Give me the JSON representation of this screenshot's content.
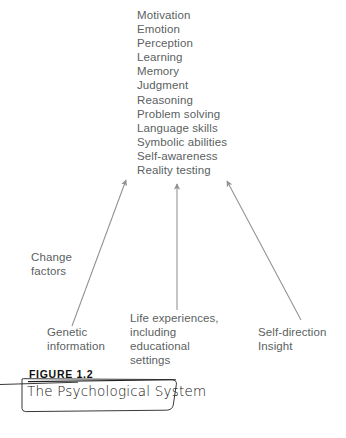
{
  "figure": {
    "number": "FIGURE 1.2",
    "title": "The Psychological System"
  },
  "outcomes": {
    "label": "Psychological system outputs",
    "items": [
      "Motivation",
      "Emotion",
      "Perception",
      "Learning",
      "Memory",
      "Judgment",
      "Reasoning",
      "Problem solving",
      "Language skills",
      "Symbolic abilities",
      "Self-awareness",
      "Reality testing"
    ]
  },
  "change_factors": {
    "label_line1": "Change",
    "label_line2": "factors"
  },
  "sources": [
    {
      "id": "genetic",
      "line1": "Genetic",
      "line2": "information",
      "line3": ""
    },
    {
      "id": "life-experiences",
      "line1": "Life experiences,",
      "line2": "including educational",
      "line3": "settings"
    },
    {
      "id": "self-direction",
      "line1": "Self-direction",
      "line2": "Insight",
      "line3": ""
    }
  ],
  "colors": {
    "text": "#5b5f62",
    "caption_text": "#111111",
    "arrow": "#8d9194",
    "caption_rule": "#222222"
  },
  "arrows": [
    {
      "name": "genetic-arrow",
      "from_x": 72,
      "from_y": 326,
      "to_x": 126,
      "to_y": 180
    },
    {
      "name": "life-experiences-arrow",
      "from_x": 177,
      "from_y": 310,
      "to_x": 177,
      "to_y": 184
    },
    {
      "name": "self-direction-arrow",
      "from_x": 301,
      "from_y": 320,
      "to_x": 227,
      "to_y": 181
    }
  ]
}
